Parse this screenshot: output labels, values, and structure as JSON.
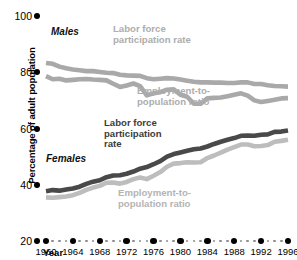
{
  "chart_data": {
    "type": "line",
    "title": "",
    "xlabel": "Year",
    "ylabel": "Percentage of adult population",
    "ylim": [
      20,
      100
    ],
    "xlim": [
      1960,
      1996
    ],
    "yticks": [
      100,
      80,
      60,
      40,
      20
    ],
    "xticks": [
      1960,
      1964,
      1968,
      1972,
      1976,
      1980,
      1984,
      1988,
      1992,
      1996
    ],
    "xticks_minor_per_interval": 3,
    "grid": false,
    "legend": "inline-annotations",
    "x": [
      1960,
      1961,
      1962,
      1963,
      1964,
      1965,
      1966,
      1967,
      1968,
      1969,
      1970,
      1971,
      1972,
      1973,
      1974,
      1975,
      1976,
      1977,
      1978,
      1979,
      1980,
      1981,
      1982,
      1983,
      1984,
      1985,
      1986,
      1987,
      1988,
      1989,
      1990,
      1991,
      1992,
      1993,
      1994,
      1995,
      1996
    ],
    "series": [
      {
        "name": "Males Labor force participation rate",
        "group": "Males",
        "measure": "Labor force participation rate",
        "color": "#a9a9a9",
        "values": [
          83.3,
          83.0,
          82.0,
          81.4,
          81.0,
          80.7,
          80.4,
          80.4,
          80.1,
          79.8,
          79.7,
          79.1,
          78.9,
          78.8,
          78.7,
          77.9,
          77.5,
          77.7,
          77.9,
          77.8,
          77.4,
          77.0,
          76.6,
          76.4,
          76.4,
          76.3,
          76.3,
          76.2,
          76.2,
          76.4,
          76.4,
          75.8,
          75.8,
          75.4,
          75.1,
          75.0,
          74.9
        ]
      },
      {
        "name": "Males Employment-to-population ratio",
        "group": "Males",
        "measure": "Employment-to-population ratio",
        "color": "#a9a9a9",
        "values": [
          78.6,
          77.5,
          77.7,
          77.1,
          77.3,
          77.5,
          77.6,
          77.4,
          77.3,
          77.1,
          75.9,
          74.8,
          75.3,
          76.0,
          75.1,
          71.8,
          72.5,
          72.9,
          73.8,
          73.9,
          72.0,
          71.3,
          68.8,
          68.8,
          70.7,
          70.9,
          71.0,
          71.5,
          72.0,
          72.5,
          71.7,
          70.0,
          69.4,
          69.8,
          70.2,
          70.7,
          70.8
        ]
      },
      {
        "name": "Females Labor force participation rate",
        "group": "Females",
        "measure": "Labor force participation rate",
        "color": "#494949",
        "values": [
          37.7,
          38.1,
          37.9,
          38.3,
          38.7,
          39.3,
          40.3,
          41.1,
          41.6,
          42.7,
          43.3,
          43.4,
          43.9,
          44.7,
          45.7,
          46.3,
          47.3,
          48.4,
          50.0,
          50.9,
          51.5,
          52.1,
          52.6,
          52.9,
          53.6,
          54.5,
          55.3,
          56.0,
          56.6,
          57.4,
          57.5,
          57.4,
          57.8,
          57.9,
          58.8,
          58.9,
          59.3
        ]
      },
      {
        "name": "Females Employment-to-population ratio",
        "group": "Females",
        "measure": "Employment-to-population ratio",
        "color": "#bdbdbd",
        "values": [
          35.5,
          35.4,
          35.6,
          35.8,
          36.3,
          37.1,
          38.2,
          39.0,
          39.6,
          40.7,
          40.8,
          40.4,
          41.0,
          42.0,
          42.6,
          42.0,
          43.2,
          44.5,
          46.4,
          47.5,
          47.7,
          48.0,
          47.9,
          48.0,
          49.5,
          50.4,
          51.4,
          52.5,
          53.4,
          54.3,
          54.3,
          53.7,
          53.8,
          54.1,
          55.3,
          55.6,
          56.0
        ]
      }
    ],
    "annotations": [
      {
        "id": "males-group",
        "text": "Males",
        "style": "group-bold-italic",
        "color": "#111111"
      },
      {
        "id": "males-lfpr",
        "text": "Labor force\nparticipation rate",
        "style": "light-gray",
        "color": "#adadad"
      },
      {
        "id": "males-epr",
        "text": "Employment-to-\npopulation ratio",
        "style": "light-gray",
        "color": "#adadad"
      },
      {
        "id": "females-group",
        "text": "Females",
        "style": "group-bold-italic",
        "color": "#111111"
      },
      {
        "id": "females-lfpr",
        "text": "Labor force\nparticipation\nrate",
        "style": "dark-gray",
        "color": "#3c3c3c"
      },
      {
        "id": "females-epr",
        "text": "Employment-to-\npopulation ratio",
        "style": "mid-gray",
        "color": "#b4b4b4"
      }
    ]
  },
  "axes": {
    "y_title": "Percentage of adult population",
    "x_title": "Year",
    "y_tick_labels": [
      "100",
      "80",
      "60",
      "40",
      "20"
    ],
    "x_tick_labels": [
      "1960",
      "1964",
      "1968",
      "1972",
      "1976",
      "1980",
      "1984",
      "1988",
      "1992",
      "1996"
    ]
  },
  "annotations_text": {
    "males_group": "Males",
    "males_lfpr": "Labor force\nparticipation rate",
    "males_epr": "Employment-to-\npopulation ratio",
    "females_group": "Females",
    "females_lfpr": "Labor force\nparticipation\nrate",
    "females_epr": "Employment-to-\npopulation ratio"
  },
  "colors": {
    "males_line": "#a9a9a9",
    "females_lfpr_line": "#494949",
    "females_epr_line": "#bdbdbd",
    "axis_dot": "#000000",
    "minor_dot": "#8d8d8d",
    "background": "#ffffff"
  }
}
